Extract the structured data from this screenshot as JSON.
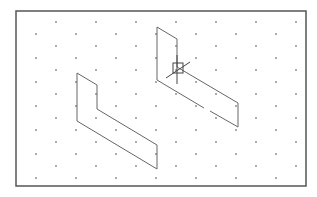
{
  "canvas": {
    "width": 317,
    "height": 197,
    "background": "#ffffff"
  },
  "frame": {
    "x": 16,
    "y": 11,
    "width": 290,
    "height": 175,
    "stroke": "#555555"
  },
  "grid": {
    "dot_color": "#555555",
    "col_spacing": 40,
    "row_spacing": 12,
    "x_start": 36,
    "y_start": 22,
    "rows": 14,
    "offset_x": 20
  },
  "shapes": [
    {
      "name": "left-l-shape",
      "stroke": "#666666",
      "points": [
        [
          77,
          73
        ],
        [
          97,
          85
        ],
        [
          97,
          109
        ],
        [
          157,
          145
        ],
        [
          157,
          169
        ],
        [
          77,
          121
        ],
        [
          77,
          73
        ]
      ]
    },
    {
      "name": "right-l-shape",
      "stroke": "#666666",
      "segments": [
        [
          [
            157,
            27
          ],
          [
            157,
            80
          ]
        ],
        [
          [
            157,
            27
          ],
          [
            177,
            39
          ]
        ],
        [
          [
            177,
            39
          ],
          [
            177,
            67
          ]
        ],
        [
          [
            177,
            67
          ],
          [
            238,
            103
          ]
        ],
        [
          [
            238,
            103
          ],
          [
            238,
            127
          ]
        ],
        [
          [
            157,
            80
          ],
          [
            204,
            108
          ]
        ],
        [
          [
            210,
            111
          ],
          [
            238,
            127
          ]
        ]
      ]
    }
  ],
  "cursor": {
    "name": "crosshair-cursor",
    "box": [
      173,
      63,
      10,
      10
    ],
    "v_line": [
      [
        177,
        55
      ],
      [
        177,
        84
      ]
    ],
    "d_line": [
      [
        166,
        78
      ],
      [
        190,
        62
      ]
    ],
    "stroke": "#444444"
  }
}
